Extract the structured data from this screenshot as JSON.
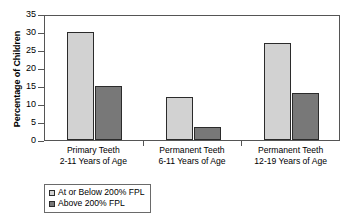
{
  "chart_data": {
    "type": "bar",
    "title": "",
    "xlabel": "",
    "ylabel": "Percentage of Children",
    "ylim": [
      0,
      35
    ],
    "ytick_step": 5,
    "yticks": [
      0,
      5,
      10,
      15,
      20,
      25,
      30,
      35
    ],
    "ytick_labels": [
      "0",
      "5",
      "10",
      "15",
      "20",
      "25",
      "30",
      "35"
    ],
    "grid": false,
    "legend_position": "bottom-left",
    "categories": [
      "Primary Teeth\n2-11 Years of Age",
      "Permanent Teeth\n6-11 Years of Age",
      "Permanent Teeth\n12-19 Years of Age"
    ],
    "category_lines": [
      {
        "line1": "Primary Teeth",
        "line2": "2-11 Years of Age"
      },
      {
        "line1": "Permanent Teeth",
        "line2": "6-11 Years of Age"
      },
      {
        "line1": "Permanent Teeth",
        "line2": "12-19 Years of Age"
      }
    ],
    "series": [
      {
        "name": "At or Below 200% FPL",
        "color": "#d2d2d2",
        "values": [
          30,
          12,
          27
        ]
      },
      {
        "name": "Above 200% FPL",
        "color": "#787878",
        "values": [
          15,
          3.5,
          13
        ]
      }
    ]
  },
  "legend": {
    "items": [
      {
        "label": "At or Below 200% FPL",
        "swatch": "light"
      },
      {
        "label": "Above 200% FPL",
        "swatch": "dark"
      }
    ]
  }
}
